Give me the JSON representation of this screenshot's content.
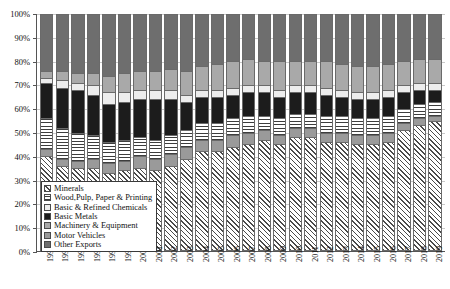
{
  "chart_data": {
    "type": "bar",
    "stacked": true,
    "stack_mode": "percent",
    "title": "",
    "subtitle": "",
    "xlabel": "",
    "ylabel": "",
    "ylim": [
      0,
      100
    ],
    "grid": true,
    "legend_position": "inside-bottom-left",
    "ytick_labels": [
      "0%",
      "10%",
      "20%",
      "30%",
      "40%",
      "50%",
      "60%",
      "70%",
      "80%",
      "90%",
      "100%"
    ],
    "ytick_values": [
      0,
      10,
      20,
      30,
      40,
      50,
      60,
      70,
      80,
      90,
      100
    ],
    "categories": [
      "1994",
      "1995",
      "1996",
      "1997",
      "1998",
      "1999",
      "2000",
      "2001",
      "2002",
      "2003",
      "2004",
      "2005",
      "2006",
      "2007",
      "2008",
      "2009",
      "2010",
      "2011",
      "2012",
      "2013",
      "2014",
      "2015",
      "2016",
      "2017",
      "2018",
      "2019"
    ],
    "stack_order_bottom_to_top": [
      "Minerals",
      "Motor Vehicles",
      "Wood,Pulp, Paper & Printing",
      "Basic Metals",
      "Basic & Refined Chemicals",
      "Machinery & Equipment",
      "Other Exports"
    ],
    "series": [
      {
        "name": "Minerals",
        "pattern": "diagonal-hatch",
        "color": "#4a4a4a",
        "values": [
          40,
          36,
          35,
          35,
          33,
          34,
          35,
          34,
          36,
          39,
          42,
          42,
          44,
          45,
          47,
          45,
          48,
          48,
          46,
          46,
          45,
          45,
          46,
          51,
          53,
          55
        ]
      },
      {
        "name": "Motor Vehicles",
        "pattern": "solid-medium-gray",
        "color": "#9a9a9a",
        "values": [
          3,
          3,
          3,
          4,
          4,
          4,
          5,
          5,
          5,
          5,
          5,
          5,
          5,
          5,
          4,
          4,
          4,
          4,
          4,
          4,
          4,
          4,
          4,
          3,
          3,
          2
        ]
      },
      {
        "name": "Wood,Pulp, Paper & Printing",
        "pattern": "horizontal-stripes",
        "color": "#3d3d3d",
        "values": [
          13,
          13,
          12,
          10,
          9,
          9,
          8,
          8,
          8,
          7,
          7,
          7,
          7,
          7,
          6,
          7,
          6,
          6,
          7,
          7,
          7,
          7,
          7,
          6,
          6,
          6
        ]
      },
      {
        "name": "Basic Metals",
        "pattern": "solid-black",
        "color": "#1c1c1c",
        "values": [
          15,
          17,
          18,
          17,
          16,
          16,
          16,
          17,
          15,
          12,
          11,
          11,
          10,
          10,
          10,
          9,
          9,
          9,
          9,
          8,
          8,
          8,
          8,
          7,
          6,
          5
        ]
      },
      {
        "name": "Basic & Refined Chemicals",
        "pattern": "solid-very-light-gray",
        "color": "#ededed",
        "values": [
          2,
          3,
          3,
          4,
          5,
          4,
          4,
          4,
          4,
          3,
          3,
          3,
          3,
          3,
          3,
          3,
          3,
          3,
          3,
          3,
          3,
          3,
          3,
          3,
          3,
          3
        ]
      },
      {
        "name": "Machinery & Equipment",
        "pattern": "solid-light-gray",
        "color": "#a9a9a9",
        "values": [
          3,
          4,
          4,
          5,
          7,
          8,
          8,
          8,
          9,
          10,
          10,
          11,
          11,
          11,
          10,
          12,
          10,
          10,
          11,
          11,
          11,
          11,
          11,
          10,
          10,
          10
        ]
      },
      {
        "name": "Other Exports",
        "pattern": "solid-dark-gray",
        "color": "#6e6e6e",
        "values": [
          24,
          24,
          25,
          25,
          26,
          25,
          24,
          24,
          23,
          24,
          22,
          21,
          20,
          19,
          20,
          20,
          20,
          20,
          20,
          21,
          22,
          22,
          21,
          20,
          19,
          19
        ]
      }
    ]
  },
  "legend": {
    "items": [
      {
        "label": "Minerals",
        "key": "minerals"
      },
      {
        "label": "Wood,Pulp, Paper & Printing",
        "key": "wood"
      },
      {
        "label": "Basic & Refined Chemicals",
        "key": "chem"
      },
      {
        "label": "Basic Metals",
        "key": "metals"
      },
      {
        "label": "Machinery & Equipment",
        "key": "mach"
      },
      {
        "label": "Motor Vehicles",
        "key": "motor"
      },
      {
        "label": "Other Exports",
        "key": "other"
      }
    ]
  }
}
